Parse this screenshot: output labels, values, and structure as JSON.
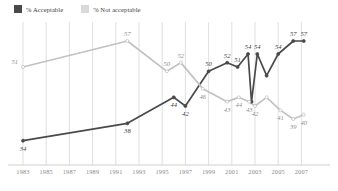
{
  "legend": {
    "items": [
      {
        "label": "% Acceptable",
        "color": "#4a4a4a",
        "swatch_name": "legend-swatch-acceptable"
      },
      {
        "label": "% Not acceptable",
        "color": "#c2c2c2",
        "swatch_name": "legend-swatch-not-acceptable"
      }
    ]
  },
  "axis": {
    "x_ticks": [
      "1983",
      "1985",
      "1987",
      "1989",
      "1991",
      "1993",
      "1995",
      "1997",
      "1999",
      "2001",
      "2003",
      "2005",
      "2007"
    ]
  },
  "colors": {
    "acceptable": "#4a4a4a",
    "not_acceptable": "#c2c2c2",
    "gridline": "#d8d8d8",
    "axis": "#c9c9c9",
    "background": "#ffffff"
  },
  "chart_data": {
    "type": "line",
    "title": "",
    "subtitle": "",
    "xlabel": "",
    "ylabel": "",
    "xlim": [
      1983,
      2007
    ],
    "ylim": [
      30,
      60
    ],
    "grid": "vertical",
    "legend_position": "top-left",
    "tick_labels": [
      "1983",
      "1985",
      "1987",
      "1989",
      "1991",
      "1993",
      "1995",
      "1997",
      "1999",
      "2001",
      "2003",
      "2005",
      "2007"
    ],
    "series": [
      {
        "name": "% Acceptable",
        "color": "#4a4a4a",
        "points": [
          {
            "x": 1983,
            "y": 34,
            "label": "34",
            "label_pos": "below"
          },
          {
            "x": 1992,
            "y": 38,
            "label": "38",
            "label_pos": "below"
          },
          {
            "x": 1996,
            "y": 44,
            "label": "44",
            "label_pos": "below"
          },
          {
            "x": 1997,
            "y": 42,
            "label": "42",
            "label_pos": "below"
          },
          {
            "x": 1999,
            "y": 50,
            "label": "50",
            "label_pos": "above"
          },
          {
            "x": 2000.6,
            "y": 52,
            "label": "52",
            "label_pos": "above"
          },
          {
            "x": 2001.5,
            "y": 51,
            "label": "51",
            "label_pos": "above"
          },
          {
            "x": 2002.4,
            "y": 54,
            "label": "54",
            "label_pos": "above"
          },
          {
            "x": 2002.7,
            "y": 43,
            "label": "",
            "label_pos": "none"
          },
          {
            "x": 2003.2,
            "y": 54,
            "label": "54",
            "label_pos": "above"
          },
          {
            "x": 2004.0,
            "y": 49,
            "label": "",
            "label_pos": "none"
          },
          {
            "x": 2005.0,
            "y": 54,
            "label": "54",
            "label_pos": "above"
          },
          {
            "x": 2006.3,
            "y": 57,
            "label": "57",
            "label_pos": "above"
          },
          {
            "x": 2007.2,
            "y": 57,
            "label": "57",
            "label_pos": "above"
          }
        ]
      },
      {
        "name": "% Not acceptable",
        "color": "#c2c2c2",
        "points": [
          {
            "x": 1983,
            "y": 51,
            "label": "51",
            "label_pos": "left"
          },
          {
            "x": 1992,
            "y": 57,
            "label": "57",
            "label_pos": "above"
          },
          {
            "x": 1995.4,
            "y": 50,
            "label": "50",
            "label_pos": "above"
          },
          {
            "x": 1996.6,
            "y": 52,
            "label": "52",
            "label_pos": "above"
          },
          {
            "x": 1998.5,
            "y": 46,
            "label": "46",
            "label_pos": "below"
          },
          {
            "x": 2000.6,
            "y": 43,
            "label": "43",
            "label_pos": "below"
          },
          {
            "x": 2001.6,
            "y": 44,
            "label": "44",
            "label_pos": "below"
          },
          {
            "x": 2002.5,
            "y": 43,
            "label": "43",
            "label_pos": "below"
          },
          {
            "x": 2003.0,
            "y": 42,
            "label": "42",
            "label_pos": "below"
          },
          {
            "x": 2004.0,
            "y": 44,
            "label": "",
            "label_pos": "none"
          },
          {
            "x": 2005.2,
            "y": 41,
            "label": "41",
            "label_pos": "below"
          },
          {
            "x": 2006.3,
            "y": 39,
            "label": "39",
            "label_pos": "below"
          },
          {
            "x": 2007.2,
            "y": 40,
            "label": "40",
            "label_pos": "below"
          }
        ]
      }
    ]
  }
}
